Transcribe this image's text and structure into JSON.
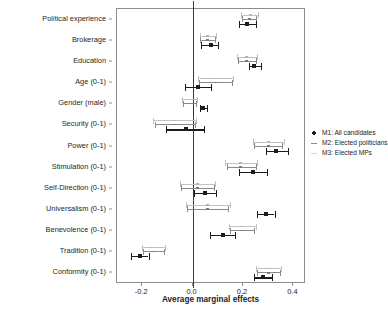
{
  "chart_data": {
    "type": "scatter",
    "title": "",
    "xlabel": "Average marginal effects",
    "ylabel": "",
    "xlim": [
      -0.3,
      0.45
    ],
    "xticks": [
      -0.2,
      0.0,
      0.2,
      0.4
    ],
    "xticklabels": [
      "-0.2",
      "0.0",
      "0.2",
      "0.4"
    ],
    "grid": false,
    "reference_line": 0.0,
    "legend_position": "right",
    "categories": [
      "Political experience",
      "Brokerage",
      "Education",
      "Age (0-1)",
      "Gender (male)",
      "Security (0-1)",
      "Power (0-1)",
      "Stimulation (0-1)",
      "Self-Direction (0-1)",
      "Universalism (0-1)",
      "Benevolence (0-1)",
      "Tradition (0-1)",
      "Conformity (0-1)"
    ],
    "series": [
      {
        "name": "M1: All candidates",
        "key": "m1",
        "color": "#1c1c1c",
        "estimates": [
          0.215,
          0.073,
          0.245,
          0.022,
          0.043,
          -0.028,
          0.33,
          0.24,
          0.048,
          0.29,
          0.12,
          -0.21,
          0.28
        ],
        "ci_low": [
          0.185,
          0.035,
          0.225,
          -0.03,
          0.03,
          -0.105,
          0.29,
          0.185,
          0.005,
          0.255,
          0.07,
          -0.245,
          0.245
        ],
        "ci_high": [
          0.25,
          0.102,
          0.27,
          0.072,
          0.058,
          0.045,
          0.38,
          0.295,
          0.092,
          0.325,
          0.17,
          -0.175,
          0.315
        ]
      },
      {
        "name": "M2: Elected politicians",
        "key": "m2",
        "color": "#8a8a8a",
        "estimates": [
          0.225,
          0.06,
          0.215,
          0.09,
          0.0,
          -0.072,
          0.3,
          0.19,
          0.018,
          0.058,
          0.195,
          -0.16,
          0.3
        ],
        "ci_low": [
          0.195,
          0.03,
          0.18,
          0.025,
          -0.038,
          -0.15,
          0.245,
          0.135,
          -0.045,
          -0.022,
          0.15,
          -0.195,
          0.255
        ],
        "ci_high": [
          0.252,
          0.09,
          0.25,
          0.155,
          0.012,
          0.01,
          0.355,
          0.25,
          0.085,
          0.142,
          0.245,
          -0.112,
          0.345
        ]
      },
      {
        "name": "M3: Elected MPs",
        "key": "m3",
        "color": "#c2c2c2",
        "estimates": [
          0.228,
          0.058,
          0.212,
          0.092,
          0.002,
          -0.075,
          0.302,
          0.19,
          0.02,
          0.06,
          0.198,
          -0.162,
          0.305
        ],
        "ci_low": [
          0.192,
          0.028,
          0.178,
          0.02,
          -0.042,
          -0.158,
          0.24,
          0.128,
          -0.05,
          -0.028,
          0.145,
          -0.2,
          0.25
        ],
        "ci_high": [
          0.258,
          0.092,
          0.255,
          0.162,
          0.016,
          0.015,
          0.362,
          0.255,
          0.09,
          0.15,
          0.252,
          -0.108,
          0.352
        ]
      }
    ],
    "legend": [
      {
        "label": "M1: All candidates",
        "key": "m1"
      },
      {
        "label": "M2: Elected politicians",
        "key": "m2"
      },
      {
        "label": "M3: Elected MPs",
        "key": "m3"
      }
    ]
  }
}
